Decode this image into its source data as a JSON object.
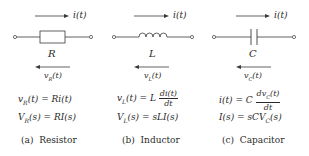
{
  "panels": [
    {
      "id": "a",
      "element_symbol": "R",
      "current_label": "i(t)",
      "voltage_label": "v_R(t)",
      "time_eq": "v_R(t) = Ri(t)",
      "laplace_eq": "V_R(s) = RI(s)",
      "caption_tag": "(a)",
      "caption_name": "Resistor"
    },
    {
      "id": "b",
      "element_symbol": "L",
      "current_label": "i(t)",
      "voltage_label": "v_L(t)",
      "time_eq": "v_L(t) = L di(t)/dt",
      "laplace_eq": "V_L(s) = sLI(s)",
      "caption_tag": "(b)",
      "caption_name": "Inductor"
    },
    {
      "id": "c",
      "element_symbol": "C",
      "current_label": "i(t)",
      "voltage_label": "v_C(t)",
      "time_eq": "i(t) = C dv_C(t)/dt",
      "laplace_eq": "I(s) = sCV_C(s)",
      "caption_tag": "(c)",
      "caption_name": "Capacitor"
    }
  ],
  "text": {
    "a": {
      "sym": "R",
      "i": "i(t)",
      "v_base": "v",
      "v_sub": "R",
      "v_tail": "(t)",
      "eq1_lhs_base": "v",
      "eq1_lhs_sub": "R",
      "eq1_rest": "(t) = Ri(t)",
      "eq2_lhs_base": "V",
      "eq2_lhs_sub": "R",
      "eq2_rest": "(s) = RI(s)",
      "cap_tag": "(a)",
      "cap_name": "Resistor"
    },
    "b": {
      "sym": "L",
      "i": "i(t)",
      "v_base": "v",
      "v_sub": "L",
      "v_tail": "(t)",
      "eq1_lhs_base": "v",
      "eq1_lhs_sub": "L",
      "eq1_mid": "(t) = L",
      "eq1_num": "di(t)",
      "eq1_den": "dt",
      "eq2_lhs_base": "V",
      "eq2_lhs_sub": "L",
      "eq2_rest": "(s) = sLI(s)",
      "cap_tag": "(b)",
      "cap_name": "Inductor"
    },
    "c": {
      "sym": "C",
      "i": "i(t)",
      "v_base": "v",
      "v_sub": "C",
      "v_tail": "(t)",
      "eq1_lhs": "i(t) = C",
      "eq1_num_base": "dv",
      "eq1_num_sub": "C",
      "eq1_num_tail": "(t)",
      "eq1_den": "dt",
      "eq2_lhs": "I(s) = sCV",
      "eq2_sub": "C",
      "eq2_tail": "(s)",
      "cap_tag": "(c)",
      "cap_name": "Capacitor"
    }
  },
  "colors": {
    "stroke": "#3a3a3a",
    "text": "#2a2a2a",
    "background": "#ffffff"
  }
}
